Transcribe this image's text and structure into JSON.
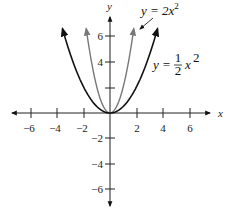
{
  "chart_data": {
    "type": "line",
    "title": "",
    "xlabel": "x",
    "ylabel": "y",
    "xlim": [
      -7.5,
      7.5
    ],
    "ylim": [
      -7.5,
      7.5
    ],
    "grid": false,
    "x_ticks": [
      -6,
      -4,
      -2,
      2,
      4,
      6
    ],
    "y_ticks": [
      -6,
      -4,
      -2,
      2,
      4,
      6
    ],
    "x_tick_labels": [
      "−6",
      "−4",
      "−2",
      "2",
      "4",
      "6"
    ],
    "y_tick_labels": [
      "−6",
      "−4",
      "−2",
      "",
      "4",
      "6"
    ],
    "series": [
      {
        "name": "y = 2x²",
        "formula": "2*x^2",
        "color": "#777777",
        "x": [
          -1.8,
          -1.5,
          -1.0,
          -0.5,
          0,
          0.5,
          1.0,
          1.5,
          1.8
        ],
        "values": [
          6.48,
          4.5,
          2.0,
          0.5,
          0,
          0.5,
          2.0,
          4.5,
          6.48
        ]
      },
      {
        "name": "y = ½x²",
        "formula": "0.5*x^2",
        "color": "#111111",
        "x": [
          -3.6,
          -3,
          -2,
          -1,
          0,
          1,
          2,
          3,
          3.6
        ],
        "values": [
          6.48,
          4.5,
          2.0,
          0.5,
          0,
          0.5,
          2.0,
          4.5,
          6.48
        ]
      }
    ],
    "annotations": [
      {
        "text": "y = 2x²",
        "points_to": "y = 2x² (narrow gray parabola)",
        "arrow": true
      },
      {
        "text": "y = ½x²",
        "points_to": "y = ½x² (wide black parabola)",
        "arrow": false
      }
    ]
  },
  "labels": {
    "x_axis": "x",
    "y_axis": "y",
    "eq_narrow_prefix": "y = 2",
    "eq_narrow_var": "x",
    "eq_narrow_exp": "2",
    "eq_wide_prefix": "y = ",
    "eq_wide_num": "1",
    "eq_wide_den": "2",
    "eq_wide_var": "x",
    "eq_wide_exp": "2"
  }
}
